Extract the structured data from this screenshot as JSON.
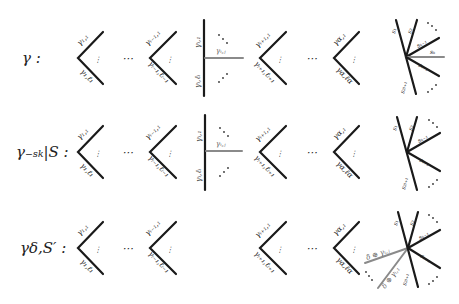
{
  "rows": [
    {
      "name": "gamma",
      "label": "γ :",
      "y": 58,
      "wedge1": {
        "top": "γ₁,₁",
        "bottom": "γ₁,ℓ₁"
      },
      "wedge2": {
        "top": "γᵢ₋₁,₁",
        "bottom": "γᵢ₋₁,ℓᵢ₋₁"
      },
      "vertical": {
        "top": "γᵢ,₁",
        "bottom": "γᵢ,ℓᵢ",
        "ray": "γᵢ,ⱼ"
      },
      "wedge3": {
        "top": "γᵢ₊₁,₁",
        "bottom": "γᵢ₊₁,ℓᵢ₊₁"
      },
      "wedge4": {
        "top": "γα,₁",
        "bottom": "γα,ℓα"
      },
      "star": {
        "s1": "s₁",
        "s2": "s₂",
        "sk_minus": "sₖ₋₁",
        "sk": "sₖ",
        "sk_plus": "sₖ₊₁",
        "s2l": "s₂ₗ₊₁"
      }
    },
    {
      "name": "gamma-minus-sk",
      "label": "γ₋ₛₖ|S :",
      "y": 152,
      "wedge1": {
        "top": "γ₁,₁",
        "bottom": "γ₁,ℓ₁"
      },
      "wedge2": {
        "top": "γᵢ₋₁,₁",
        "bottom": "γᵢ₋₁,ℓᵢ₋₁"
      },
      "vertical": {
        "top": "γᵢ,₁",
        "bottom": "γᵢ,ℓᵢ",
        "ray": "γᵢ,ⱼ"
      },
      "wedge3": {
        "top": "γᵢ₊₁,₁",
        "bottom": "γᵢ₊₁,ℓᵢ₊₁"
      },
      "wedge4": {
        "top": "γα,₁",
        "bottom": "γα,ℓα"
      },
      "star": {
        "s1": "s₁",
        "s2": "s₂",
        "sk_minus": "sₖ₋₁",
        "sk_plus": "sₖ₊₁",
        "s2l": "s₂ₗ₊₁"
      }
    },
    {
      "name": "gamma-delta-s-prime",
      "label": "γδ,S′ :",
      "y": 248,
      "wedge1": {
        "top": "γ₁,₁",
        "bottom": "γ₁,ℓ₁"
      },
      "wedge2": {
        "top": "γᵢ₋₁,₁",
        "bottom": "γᵢ₋₁,ℓᵢ₋₁"
      },
      "wedge3": {
        "top": "γᵢ₊₁,₁",
        "bottom": "γᵢ₊₁,ℓᵢ₊₁"
      },
      "wedge4": {
        "top": "γα,₁",
        "bottom": "γα,ℓα"
      },
      "star": {
        "s1": "s₁",
        "s2": "s₂",
        "sk_minus": "sₖ₋₁",
        "sk_plus": "sₖ₊₁",
        "s2l": "s₂ₗ₊₁",
        "delta_j": "δ ⊕ γᵢ,ⱼ",
        "delta_1": "δ ⊕ γᵢ,₁"
      }
    }
  ],
  "ellipsis": "⋯",
  "vdots": "⋮"
}
